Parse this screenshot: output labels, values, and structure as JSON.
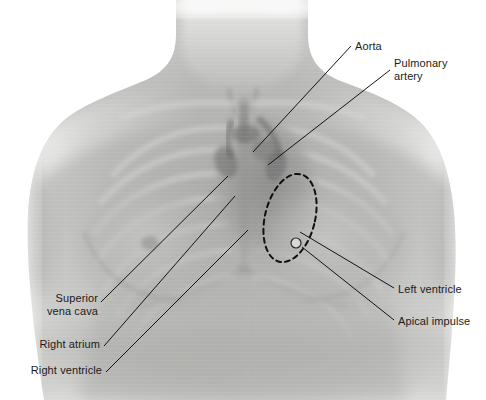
{
  "figure": {
    "kind": "chest-radiograph-cardiac-landmarks",
    "width": 486,
    "height": 400,
    "background_color": "#ffffff"
  },
  "labels": {
    "aorta": "Aorta",
    "pulmonary_artery_line1": "Pulmonary",
    "pulmonary_artery_line2": "artery",
    "left_ventricle": "Left ventricle",
    "apical_impulse": "Apical impulse",
    "superior_vena_cava_line1": "Superior",
    "superior_vena_cava_line2": "vena cava",
    "right_atrium": "Right atrium",
    "right_ventricle": "Right ventricle"
  },
  "markers": {
    "dashed_outline_name": "left-ventricle-dashed-outline",
    "apical_impulse_marker_name": "apical-impulse-marker"
  },
  "colors": {
    "label_text": "#1b1b1b",
    "leader_line": "#141414",
    "dashed_outline": "#101010",
    "apical_marker_fill": "#d8d8d4",
    "apical_marker_stroke": "#2a2a2a",
    "skin_light": "#e2e2e0",
    "skin_mid": "#b9b9b7",
    "skin_dark": "#8f8f8e",
    "bone": "#cfcfcd",
    "mediastinum": "#9a9a99",
    "background": "#ffffff"
  }
}
